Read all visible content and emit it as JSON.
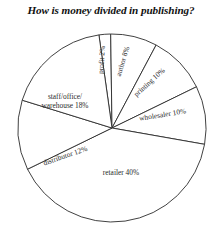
{
  "chart_data": {
    "type": "pie",
    "title": "How is money divided in publishing?",
    "xlabel": "",
    "ylabel": "",
    "legend": "none",
    "grid": false,
    "units": "percent",
    "total": 100,
    "start_angle_deg": -98,
    "direction": "clockwise",
    "categories": [
      "profit",
      "author",
      "printing",
      "wholesaler",
      "retailer",
      "distributor",
      "staff/office/warehouse"
    ],
    "values": [
      2,
      8,
      10,
      10,
      40,
      12,
      18
    ],
    "labels": [
      "profit 2%",
      "author 8%",
      "printing 10%",
      "wholesaler 10%",
      "retailer 40%",
      "distributor 12%",
      "staff/office/"
    ],
    "slices": [
      {
        "name": "profit",
        "value": 2,
        "label": "profit 2%",
        "label_line2": "",
        "rotation_deg": -86,
        "label_x": 104,
        "label_y": 60,
        "anchor": "middle"
      },
      {
        "name": "author",
        "value": 8,
        "label": "author 8%",
        "label_line2": "",
        "rotation_deg": -73,
        "label_x": 125,
        "label_y": 62,
        "anchor": "middle"
      },
      {
        "name": "printing",
        "value": 10,
        "label": "printing 10%",
        "label_line2": "",
        "rotation_deg": -42,
        "label_x": 151,
        "label_y": 84,
        "anchor": "middle"
      },
      {
        "name": "wholesaler",
        "value": 10,
        "label": "wholesaler 10%",
        "label_line2": "",
        "rotation_deg": -9,
        "label_x": 163,
        "label_y": 117,
        "anchor": "middle"
      },
      {
        "name": "retailer",
        "value": 40,
        "label": "retailer 40%",
        "label_line2": "",
        "rotation_deg": 0,
        "label_x": 121,
        "label_y": 175,
        "anchor": "middle"
      },
      {
        "name": "distributor",
        "value": 12,
        "label": "distributor 12%",
        "label_line2": "",
        "rotation_deg": -19,
        "label_x": 66,
        "label_y": 158,
        "anchor": "middle"
      },
      {
        "name": "staff/office/warehouse",
        "value": 18,
        "label": "staff/office/",
        "label_line2": "warehouse 18%",
        "rotation_deg": 0,
        "label_x": 65,
        "label_y": 99,
        "anchor": "middle"
      }
    ],
    "colors": {
      "slice_fill": "#ffffff",
      "slice_stroke": "#2b2b2b",
      "background": "#ffffff",
      "text": "#2a2a2a",
      "title_text": "#111111"
    },
    "geometry": {
      "center_x": 112,
      "center_y": 128,
      "radius": 94
    }
  }
}
